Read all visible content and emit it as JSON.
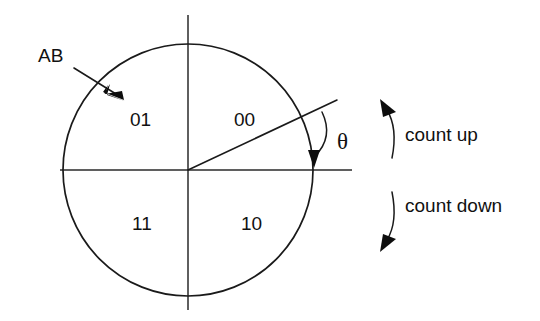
{
  "diagram": {
    "background_color": "#ffffff",
    "line_color": "#1a1a1a",
    "geometry": {
      "center_x": 188,
      "center_y": 170,
      "radius": 126,
      "h_axis_x1": 60,
      "h_axis_x2": 352,
      "v_axis_y1": 15,
      "v_axis_y2": 310,
      "angle_ray_degrees": 25,
      "angle_ray_end_x": 337,
      "angle_ray_end_y": 100
    },
    "pointer_label": {
      "text": "AB",
      "x": 38,
      "y": 62,
      "arrow_from_x": 74,
      "arrow_from_y": 68,
      "arrow_to_x": 122,
      "arrow_to_y": 98
    },
    "quadrants": [
      {
        "code": "01",
        "quadrant": "upper-left",
        "x": 130,
        "y": 126
      },
      {
        "code": "00",
        "quadrant": "upper-right",
        "x": 234,
        "y": 126
      },
      {
        "code": "11",
        "quadrant": "lower-left",
        "x": 132,
        "y": 230
      },
      {
        "code": "10",
        "quadrant": "lower-right",
        "x": 241,
        "y": 230
      }
    ],
    "angle_marker": {
      "symbol": "θ",
      "x": 337,
      "y": 149,
      "arc_start_x": 321,
      "arc_start_y": 112,
      "arc_end_x": 313,
      "arc_end_y": 163
    },
    "rotation_labels": [
      {
        "text": "count up",
        "direction": "counterclockwise",
        "text_x": 405,
        "text_y": 141,
        "arrow_tip_x": 383,
        "arrow_tip_y": 103
      },
      {
        "text": "count down",
        "direction": "clockwise",
        "text_x": 405,
        "text_y": 212,
        "arrow_tip_x": 382,
        "arrow_tip_y": 249
      }
    ]
  }
}
